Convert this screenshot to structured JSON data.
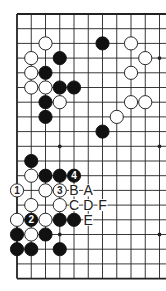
{
  "diagram": {
    "type": "go-board-partial",
    "columns_shown": 11,
    "rows_shown": 19,
    "open_right_edge": true,
    "colors": {
      "line": "#222222",
      "black_stone": "#111111",
      "white_stone": "#ffffff",
      "label": "#222222"
    },
    "star_points": [
      {
        "col": 11,
        "row": 4
      },
      {
        "col": 4,
        "row": 10
      },
      {
        "col": 11,
        "row": 10
      },
      {
        "col": 4,
        "row": 16
      },
      {
        "col": 11,
        "row": 16
      }
    ],
    "stones": [
      {
        "col": 3,
        "row": 3,
        "color": "white"
      },
      {
        "col": 7,
        "row": 3,
        "color": "black"
      },
      {
        "col": 9,
        "row": 3,
        "color": "white"
      },
      {
        "col": 2,
        "row": 4,
        "color": "white"
      },
      {
        "col": 4,
        "row": 4,
        "color": "black"
      },
      {
        "col": 10,
        "row": 4,
        "color": "white"
      },
      {
        "col": 2,
        "row": 5,
        "color": "white"
      },
      {
        "col": 3,
        "row": 5,
        "color": "black"
      },
      {
        "col": 9,
        "row": 5,
        "color": "white"
      },
      {
        "col": 2,
        "row": 6,
        "color": "white"
      },
      {
        "col": 3,
        "row": 6,
        "color": "white"
      },
      {
        "col": 4,
        "row": 6,
        "color": "black"
      },
      {
        "col": 5,
        "row": 6,
        "color": "black"
      },
      {
        "col": 3,
        "row": 7,
        "color": "black"
      },
      {
        "col": 4,
        "row": 7,
        "color": "white"
      },
      {
        "col": 9,
        "row": 7,
        "color": "white"
      },
      {
        "col": 10,
        "row": 7,
        "color": "white"
      },
      {
        "col": 3,
        "row": 8,
        "color": "black"
      },
      {
        "col": 8,
        "row": 8,
        "color": "white"
      },
      {
        "col": 7,
        "row": 9,
        "color": "black"
      },
      {
        "col": 2,
        "row": 11,
        "color": "black"
      },
      {
        "col": 2,
        "row": 12,
        "color": "white"
      },
      {
        "col": 3,
        "row": 12,
        "color": "black"
      },
      {
        "col": 4,
        "row": 12,
        "color": "black"
      },
      {
        "col": 5,
        "row": 12,
        "color": "black",
        "label": "4"
      },
      {
        "col": 1,
        "row": 13,
        "color": "white",
        "label": "1"
      },
      {
        "col": 3,
        "row": 13,
        "color": "white"
      },
      {
        "col": 4,
        "row": 13,
        "color": "white",
        "label": "3"
      },
      {
        "col": 2,
        "row": 14,
        "color": "white"
      },
      {
        "col": 4,
        "row": 14,
        "color": "white"
      },
      {
        "col": 1,
        "row": 15,
        "color": "white"
      },
      {
        "col": 2,
        "row": 15,
        "color": "black",
        "label": "2"
      },
      {
        "col": 3,
        "row": 15,
        "color": "white"
      },
      {
        "col": 4,
        "row": 15,
        "color": "black"
      },
      {
        "col": 5,
        "row": 15,
        "color": "black"
      },
      {
        "col": 1,
        "row": 16,
        "color": "black"
      },
      {
        "col": 2,
        "row": 16,
        "color": "white"
      },
      {
        "col": 3,
        "row": 16,
        "color": "black"
      },
      {
        "col": 1,
        "row": 17,
        "color": "black"
      },
      {
        "col": 2,
        "row": 17,
        "color": "black"
      },
      {
        "col": 4,
        "row": 17,
        "color": "black"
      }
    ],
    "letter_labels": [
      {
        "col": 5,
        "row": 13,
        "text": "B"
      },
      {
        "col": 6,
        "row": 13,
        "text": "A"
      },
      {
        "col": 5,
        "row": 14,
        "text": "C"
      },
      {
        "col": 6,
        "row": 14,
        "text": "D"
      },
      {
        "col": 7,
        "row": 14,
        "text": "F"
      },
      {
        "col": 6,
        "row": 15,
        "text": "E"
      }
    ]
  }
}
